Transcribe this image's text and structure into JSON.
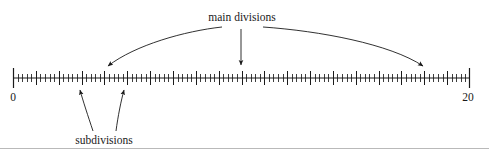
{
  "figure": {
    "title_text": "main divisions",
    "subtitle_text": "subdivisions",
    "background_color": "#ffffff",
    "ink_color": "#1a1a1a",
    "rule_color": "#b9b9b9"
  },
  "labels": {
    "main_divisions": "main divisions",
    "subdivisions": "subdivisions",
    "axis_start": "0",
    "axis_end": "20"
  },
  "chart_data": {
    "type": "line",
    "title": "main divisions",
    "xlabel": "",
    "ylabel": "",
    "grid": false,
    "legend_position": "none",
    "axis": {
      "orientation": "horizontal",
      "min": 0,
      "max": 20,
      "major_division_count": 20,
      "subdivisions_per_major": 5,
      "minor_ticks_between_majors": 4,
      "tick_labels": [
        "0",
        "20"
      ],
      "tick_label_values": [
        0,
        20
      ],
      "pixel_start_x": 13,
      "pixel_end_x": 470,
      "baseline_y": 78,
      "end_cap_half_height": 10,
      "major_tick_half_height": 7,
      "minor_tick_half_height": 4
    },
    "annotations": [
      {
        "id": "main-divisions",
        "text": "main divisions",
        "text_x": 242,
        "text_y": 20,
        "pointer_count": 3,
        "pointers": [
          {
            "kind": "curved-arrow",
            "direction": "left",
            "target_value": 4,
            "target_x": 105,
            "target_y": 70
          },
          {
            "kind": "straight-arrow",
            "direction": "down",
            "target_value": 10,
            "target_x": 241,
            "target_y": 70
          },
          {
            "kind": "curved-arrow",
            "direction": "right",
            "target_value": 18,
            "target_x": 425,
            "target_y": 70
          }
        ]
      },
      {
        "id": "subdivisions",
        "text": "subdivisions",
        "text_x": 104,
        "text_y": 140,
        "pointer_count": 2,
        "pointers": [
          {
            "kind": "curved-arrow",
            "direction": "up",
            "target_value": 2.8,
            "target_x": 80,
            "target_y": 86
          },
          {
            "kind": "curved-arrow",
            "direction": "up",
            "target_value": 4.8,
            "target_x": 124,
            "target_y": 86
          }
        ]
      }
    ],
    "footer_rule": {
      "y": 148,
      "x_start": 0,
      "x_end": 489
    }
  }
}
